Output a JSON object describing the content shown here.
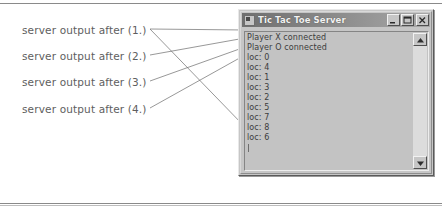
{
  "figure": {
    "caption_font_color": "#5e5e5e"
  },
  "annotations": [
    {
      "label": "server output after (1.)",
      "target_line": 0
    },
    {
      "label": "server output after (2.)",
      "target_line": 1
    },
    {
      "label": "server output after (3.)",
      "target_line": 2
    },
    {
      "label": "server output after (4.)",
      "target_line": 3
    }
  ],
  "window": {
    "title": "Tic Tac Toe Server",
    "icon": "app-icon",
    "titlebar_color_left": "#6f6f6f",
    "titlebar_color_right": "#a8a8a8",
    "buttons": [
      {
        "name": "minimize",
        "glyph": "_"
      },
      {
        "name": "maximize",
        "glyph": "□"
      },
      {
        "name": "close",
        "glyph": "×"
      }
    ],
    "output": {
      "lines": [
        "Player X connected",
        "Player O connected",
        "loc: 0",
        "loc: 4",
        "loc: 1",
        "loc: 3",
        "loc: 2",
        "loc: 5",
        "loc: 7",
        "loc: 8",
        "loc: 6"
      ]
    },
    "scrollbar": {
      "up_arrow": "scroll-up-icon",
      "down_arrow": "scroll-down-icon"
    }
  }
}
